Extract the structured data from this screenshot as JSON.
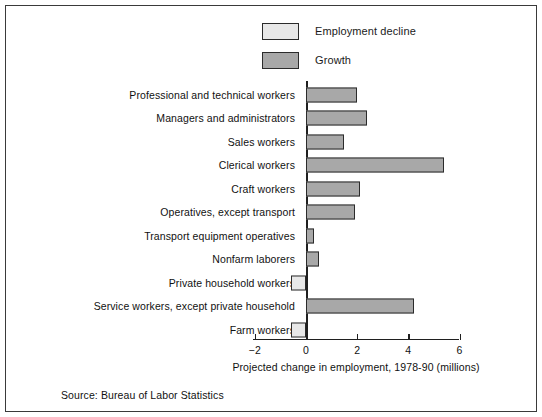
{
  "chart_data": {
    "type": "bar",
    "orientation": "horizontal",
    "title": "",
    "xlabel": "Projected change in employment, 1978-90 (millions)",
    "ylabel": "",
    "xlim": [
      -2,
      6
    ],
    "xticks": [
      -2,
      0,
      2,
      4,
      6
    ],
    "xticklabels": [
      "−2",
      "0",
      "2",
      "4",
      "6"
    ],
    "grid": false,
    "legend_position": "top-center",
    "legend": [
      {
        "label": "Employment decline",
        "color": "#e8e8e8",
        "key": "decline"
      },
      {
        "label": "Growth",
        "color": "#a8a8a8",
        "key": "growth"
      }
    ],
    "categories": [
      "Professional and technical workers",
      "Managers and administrators",
      "Sales workers",
      "Clerical workers",
      "Craft workers",
      "Operatives, except transport",
      "Transport equipment operatives",
      "Nonfarm laborers",
      "Private household workers",
      "Service workers, except private household",
      "Farm workers"
    ],
    "values": [
      2.0,
      2.4,
      1.5,
      5.4,
      2.1,
      1.9,
      0.3,
      0.5,
      -0.6,
      4.2,
      -0.6
    ],
    "series_keys": [
      "growth",
      "growth",
      "growth",
      "growth",
      "growth",
      "growth",
      "growth",
      "growth",
      "decline",
      "growth",
      "decline"
    ],
    "annotations": {
      "source": "Source: Bureau of Labor Statistics"
    }
  },
  "colors": {
    "decline": "#e8e8e8",
    "growth": "#a8a8a8",
    "outline": "#2b2b2b",
    "axis": "#1f1f1f",
    "text": "#111111",
    "frame": "#3a3a3a",
    "background": "#ffffff"
  }
}
